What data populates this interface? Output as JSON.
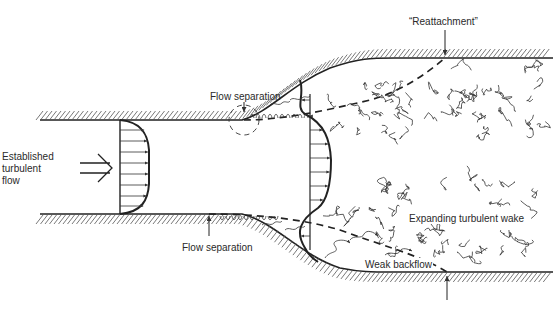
{
  "diagram": {
    "labels": {
      "inlet_flow": [
        "Established",
        "turbulent",
        "flow"
      ],
      "separation_top": "Flow separation",
      "separation_bottom": "Flow separation",
      "reattachment": "“Reattachment”",
      "wake": "Expanding turbulent wake",
      "backflow": "Weak backflow"
    },
    "icons": {
      "inlet_arrow": "double-arrow-right",
      "velocity_vectors": "arrow-right"
    },
    "colors": {
      "ink": "#222222",
      "background": "#ffffff"
    }
  }
}
